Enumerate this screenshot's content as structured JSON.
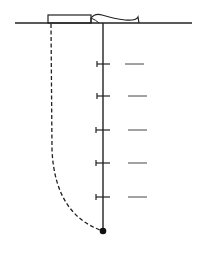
{
  "diagram": {
    "type": "well-profile",
    "colors": {
      "line": "#222222",
      "background": "#ffffff"
    },
    "surface_y": 23,
    "borehole": {
      "x": 103,
      "top": 23,
      "bottom": 231
    },
    "markers_y": [
      64,
      96,
      130,
      163,
      197
    ],
    "dashes_right": [
      {
        "x1": 128,
        "x2": 145
      }
    ]
  }
}
